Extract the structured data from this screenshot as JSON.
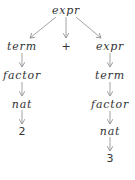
{
  "diagram": {
    "colors": {
      "text": "#333333",
      "edge": "#8a8a8a",
      "background": "#ffffff"
    },
    "nodes": [
      {
        "id": "root",
        "label": "expr",
        "x": 66,
        "y": 10,
        "italic": true
      },
      {
        "id": "term1",
        "label": "term",
        "x": 22,
        "y": 46,
        "italic": true
      },
      {
        "id": "plus",
        "label": "+",
        "x": 66,
        "y": 46,
        "italic": false
      },
      {
        "id": "expr2",
        "label": "expr",
        "x": 110,
        "y": 46,
        "italic": true
      },
      {
        "id": "factor1",
        "label": "factor",
        "x": 22,
        "y": 75,
        "italic": true
      },
      {
        "id": "term2",
        "label": "term",
        "x": 110,
        "y": 75,
        "italic": true
      },
      {
        "id": "nat1",
        "label": "nat",
        "x": 22,
        "y": 104,
        "italic": true
      },
      {
        "id": "factor2",
        "label": "factor",
        "x": 110,
        "y": 104,
        "italic": true
      },
      {
        "id": "num2",
        "label": "2",
        "x": 22,
        "y": 131,
        "italic": false
      },
      {
        "id": "nat2",
        "label": "nat",
        "x": 110,
        "y": 131,
        "italic": true
      },
      {
        "id": "num3",
        "label": "3",
        "x": 110,
        "y": 158,
        "italic": false
      }
    ],
    "edges": [
      {
        "from": "root",
        "to": "term1",
        "x1": 56,
        "y1": 17,
        "x2": 30,
        "y2": 38
      },
      {
        "from": "root",
        "to": "plus",
        "x1": 66,
        "y1": 17,
        "x2": 66,
        "y2": 38
      },
      {
        "from": "root",
        "to": "expr2",
        "x1": 76,
        "y1": 17,
        "x2": 101,
        "y2": 38
      },
      {
        "from": "term1",
        "to": "factor1",
        "x1": 22,
        "y1": 53,
        "x2": 22,
        "y2": 67
      },
      {
        "from": "expr2",
        "to": "term2",
        "x1": 110,
        "y1": 53,
        "x2": 110,
        "y2": 67
      },
      {
        "from": "factor1",
        "to": "nat1",
        "x1": 22,
        "y1": 82,
        "x2": 22,
        "y2": 96
      },
      {
        "from": "term2",
        "to": "factor2",
        "x1": 110,
        "y1": 82,
        "x2": 110,
        "y2": 96
      },
      {
        "from": "nat1",
        "to": "num2",
        "x1": 22,
        "y1": 110,
        "x2": 22,
        "y2": 124
      },
      {
        "from": "factor2",
        "to": "nat2",
        "x1": 110,
        "y1": 111,
        "x2": 110,
        "y2": 124
      },
      {
        "from": "nat2",
        "to": "num3",
        "x1": 110,
        "y1": 137,
        "x2": 110,
        "y2": 151
      }
    ]
  }
}
